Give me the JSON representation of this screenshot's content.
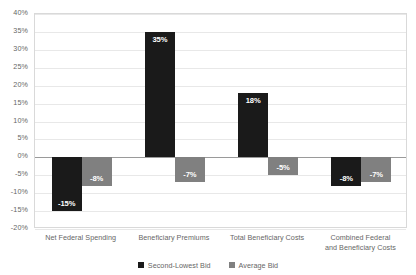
{
  "chart_data": {
    "type": "bar",
    "title": "",
    "subtitle": "",
    "xlabel": "",
    "ylabel": "",
    "ylim": [
      -20,
      40
    ],
    "ytick_step": 5,
    "grid": true,
    "legend_position": "bottom",
    "categories": [
      "Net Federal Spending",
      "Beneficiary Premiums",
      "Total Beneficiary Costs",
      "Combined Federal\nand Beneficiary Costs"
    ],
    "ytick_labels": [
      "40%",
      "35%",
      "30%",
      "25%",
      "20%",
      "15%",
      "10%",
      "5%",
      "0%",
      "-5%",
      "-10%",
      "-15%",
      "-20%"
    ],
    "ytick_values": [
      40,
      35,
      30,
      25,
      20,
      15,
      10,
      5,
      0,
      -5,
      -10,
      -15,
      -20
    ],
    "series": [
      {
        "name": "Second-Lowest Bid",
        "color": "#1a1a1a",
        "values": [
          -15,
          35,
          18,
          -8
        ],
        "data_labels": [
          "-15%",
          "35%",
          "18%",
          "-8%"
        ]
      },
      {
        "name": "Average Bid",
        "color": "#808080",
        "values": [
          -8,
          -7,
          -5,
          -7
        ],
        "data_labels": [
          "-8%",
          "-7%",
          "-5%",
          "-7%"
        ]
      }
    ]
  },
  "legend": {
    "items": [
      {
        "label": "Second-Lowest Bid",
        "color": "#1a1a1a"
      },
      {
        "label": "Average Bid",
        "color": "#808080"
      }
    ]
  },
  "colors": {
    "series_dark": "#1a1a1a",
    "series_gray": "#808080",
    "gridline": "#e8e8e8",
    "zero_line": "#9a9a9a",
    "plot_border": "#d9d9d9",
    "axis_text": "#666666",
    "data_label_text": "#ffffff",
    "background": "#ffffff"
  }
}
